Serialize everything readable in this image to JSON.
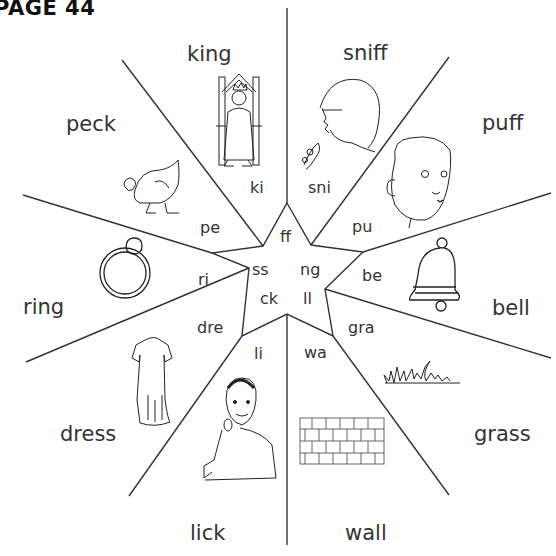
{
  "page": {
    "title": "PAGE 44"
  },
  "endings": {
    "ff": "ff",
    "ss": "ss",
    "ng": "ng",
    "ck": "ck",
    "ll": "ll"
  },
  "wedges": [
    {
      "id": "king",
      "word": "king",
      "segment": "ki",
      "picture": "king-on-throne"
    },
    {
      "id": "sniff",
      "word": "sniff",
      "segment": "sni",
      "picture": "child-sniffing-flower"
    },
    {
      "id": "puff",
      "word": "puff",
      "segment": "pu",
      "picture": "boy-puffing-cheeks"
    },
    {
      "id": "bell",
      "word": "bell",
      "segment": "be",
      "picture": "bell"
    },
    {
      "id": "grass",
      "word": "grass",
      "segment": "gra",
      "picture": "grass"
    },
    {
      "id": "wall",
      "word": "wall",
      "segment": "wa",
      "picture": "brick-wall"
    },
    {
      "id": "lick",
      "word": "lick",
      "segment": "li",
      "picture": "boy-licking-lollipop"
    },
    {
      "id": "dress",
      "word": "dress",
      "segment": "dre",
      "picture": "dress"
    },
    {
      "id": "ring",
      "word": "ring",
      "segment": "ri",
      "picture": "ring"
    },
    {
      "id": "peck",
      "word": "peck",
      "segment": "pe",
      "picture": "hen-pecking"
    }
  ],
  "colors": {
    "line": "#333333",
    "text": "#333333",
    "background": "#ffffff"
  }
}
